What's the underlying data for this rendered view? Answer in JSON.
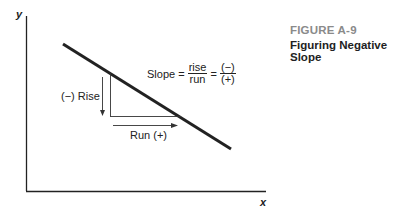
{
  "figure": {
    "number": "FIGURE A-9",
    "title": "Figuring Negative Slope"
  },
  "axes": {
    "x_label": "x",
    "y_label": "y"
  },
  "formula": {
    "prefix": "Slope =",
    "frac1_num": "rise",
    "frac1_den": "run",
    "equals": "=",
    "frac2_num": "(−)",
    "frac2_den": "(+)"
  },
  "annotations": {
    "rise_label": "(−) Rise",
    "run_label": "Run (+)"
  },
  "colors": {
    "line": "#222222",
    "figure_number": "#8a8a8a"
  }
}
